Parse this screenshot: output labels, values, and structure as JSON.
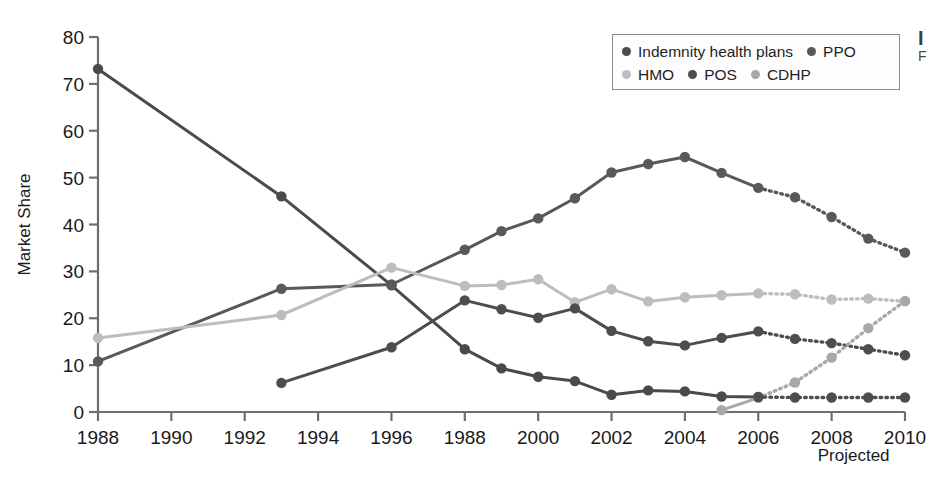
{
  "figure": {
    "background": "#ffffff",
    "side_caption_top": "I",
    "side_caption_sub": "F"
  },
  "legend": {
    "border_color": "#8b8b8b",
    "rows": [
      [
        {
          "label": "Indemnity health plans",
          "color": "#4a4a4a",
          "key": "indemnity"
        },
        {
          "label": "PPO",
          "color": "#595959",
          "key": "ppo"
        }
      ],
      [
        {
          "label": "HMO",
          "color": "#bdbdbd",
          "key": "hmo"
        },
        {
          "label": "POS",
          "color": "#4d4d4d",
          "key": "pos"
        },
        {
          "label": "CDHP",
          "color": "#a8a8a8",
          "key": "cdhp"
        }
      ]
    ]
  },
  "chart_data": {
    "type": "line",
    "title": "",
    "xlabel": "",
    "ylabel": "Market Share",
    "xlim": [
      1988,
      2010
    ],
    "ylim": [
      0,
      80
    ],
    "ytick_values": [
      0,
      10,
      20,
      30,
      40,
      50,
      60,
      70,
      80
    ],
    "ytick_labels": [
      "0",
      "10",
      "20",
      "30",
      "40",
      "50",
      "60",
      "70",
      "80"
    ],
    "xtick_values": [
      1988,
      1990,
      1992,
      1994,
      1996,
      1998,
      2000,
      2002,
      2004,
      2006,
      2008,
      2010
    ],
    "xtick_labels": [
      "1988",
      "1990",
      "1992",
      "1994",
      "1996",
      "1988",
      "2000",
      "2002",
      "2004",
      "2006",
      "2008",
      "2010"
    ],
    "grid": false,
    "legend_position": "top-right",
    "annotations": [
      {
        "text": "Projected",
        "x": 2008.6,
        "y": -10.5,
        "align": "middle"
      }
    ],
    "projection_starts_at": 2006,
    "series": [
      {
        "name": "Indemnity health plans",
        "color": "#4a4a4a",
        "x": [
          1988,
          1993,
          1996,
          1998,
          1999,
          2000,
          2001,
          2002,
          2003,
          2004,
          2005,
          2006
        ],
        "values": [
          73.2,
          46.0,
          27.0,
          13.4,
          9.3,
          7.5,
          6.6,
          3.7,
          4.6,
          4.4,
          3.3,
          3.2
        ]
      },
      {
        "name": "PPO",
        "color": "#595959",
        "x": [
          1988,
          1993,
          1996,
          1998,
          1999,
          2000,
          2001,
          2002,
          2003,
          2004,
          2005,
          2006,
          2007,
          2008,
          2009,
          2010
        ],
        "values": [
          10.8,
          26.3,
          27.2,
          34.6,
          38.6,
          41.3,
          45.6,
          51.1,
          52.9,
          54.4,
          51.0,
          47.8,
          45.8,
          41.6,
          37.0,
          34.0
        ]
      },
      {
        "name": "HMO",
        "color": "#bdbdbd",
        "x": [
          1988,
          1993,
          1996,
          1998,
          1999,
          2000,
          2001,
          2002,
          2003,
          2004,
          2005,
          2006,
          2007,
          2008,
          2009,
          2010
        ],
        "values": [
          15.8,
          20.7,
          30.8,
          26.9,
          27.1,
          28.3,
          23.4,
          26.2,
          23.6,
          24.5,
          24.9,
          25.3,
          25.1,
          24.0,
          24.2,
          23.6
        ]
      },
      {
        "name": "POS",
        "color": "#4d4d4d",
        "x": [
          1993,
          1996,
          1998,
          1999,
          2000,
          2001,
          2002,
          2003,
          2004,
          2005,
          2006,
          2007,
          2008,
          2009,
          2010
        ],
        "values": [
          6.2,
          13.8,
          23.8,
          21.9,
          20.1,
          22.1,
          17.3,
          15.1,
          14.2,
          15.8,
          17.2,
          15.6,
          14.7,
          13.4,
          12.1
        ]
      },
      {
        "name": "CDHP",
        "color": "#a8a8a8",
        "x": [
          2005,
          2006,
          2007,
          2008,
          2009,
          2010
        ],
        "values": [
          0.4,
          3.0,
          6.3,
          11.6,
          17.9,
          23.7
        ]
      },
      {
        "name": "POS flat projection",
        "color": "#4d4d4d",
        "hidden_from_legend": true,
        "x": [
          2006,
          2007,
          2008,
          2009,
          2010
        ],
        "values": [
          3.2,
          3.1,
          3.1,
          3.1,
          3.1
        ]
      }
    ]
  }
}
